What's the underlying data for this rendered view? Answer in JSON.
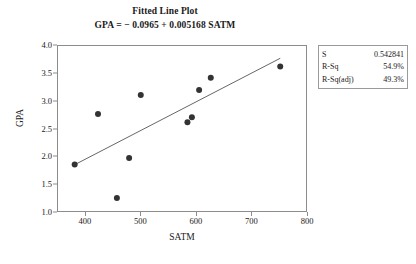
{
  "chart_data": {
    "type": "scatter",
    "title": "Fitted Line Plot",
    "subtitle": "GPA  =  − 0.0965 + 0.005168 SATM",
    "xlabel": "SATM",
    "ylabel": "GPA",
    "xlim": [
      350,
      800
    ],
    "ylim": [
      1.0,
      4.0
    ],
    "xticks": [
      400,
      500,
      600,
      700,
      800
    ],
    "yticks": [
      "4.0",
      "3.5",
      "3.0",
      "2.5",
      "2.0",
      "1.5",
      "1.0"
    ],
    "grid": false,
    "legend": "none",
    "point_color": "#333333",
    "line_color": "#555555",
    "points": [
      {
        "x": 380,
        "y": 1.87
      },
      {
        "x": 422,
        "y": 2.78
      },
      {
        "x": 456,
        "y": 1.27
      },
      {
        "x": 478,
        "y": 1.99
      },
      {
        "x": 499,
        "y": 3.12
      },
      {
        "x": 583,
        "y": 2.63
      },
      {
        "x": 591,
        "y": 2.72
      },
      {
        "x": 604,
        "y": 3.21
      },
      {
        "x": 625,
        "y": 3.43
      },
      {
        "x": 750,
        "y": 3.63
      }
    ],
    "fit_line": {
      "intercept": -0.0965,
      "slope": 0.005168,
      "x_start": 380,
      "x_end": 750
    },
    "annotations": {
      "stats": [
        {
          "key": "S",
          "value": "0.542841"
        },
        {
          "key": "R-Sq",
          "value": "54.9%"
        },
        {
          "key": "R-Sq(adj)",
          "value": "49.3%"
        }
      ]
    }
  }
}
